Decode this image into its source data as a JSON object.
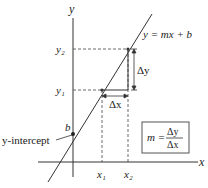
{
  "diagram": {
    "axes": {
      "x_label": "x",
      "y_label": "y"
    },
    "line": {
      "equation": "y = mx + b"
    },
    "points": {
      "y1": "y₁",
      "y2": "y₂",
      "x1": "x₁",
      "x2": "x₂",
      "b": "b"
    },
    "deltas": {
      "dx": "Δx",
      "dy": "Δy"
    },
    "intercept_label": "y-intercept",
    "slope_box": {
      "lhs": "m =",
      "numerator": "Δy",
      "denominator": "Δx"
    },
    "colors": {
      "ink": "#222222",
      "box_border": "#555555",
      "background": "#ffffff"
    }
  }
}
